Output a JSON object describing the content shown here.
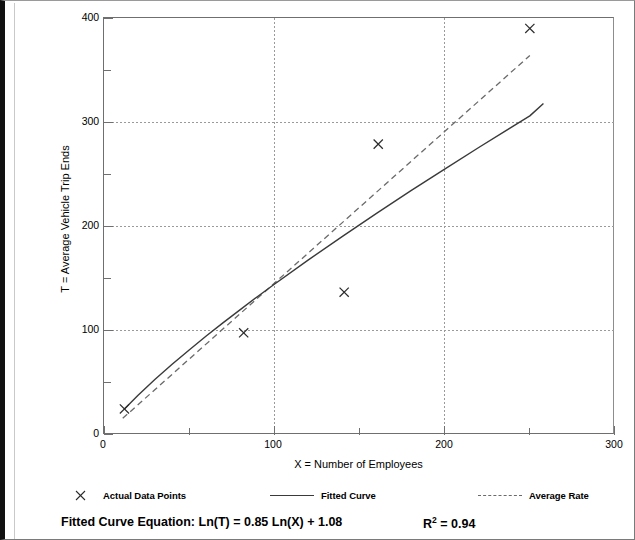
{
  "chart_data": {
    "type": "scatter",
    "title": "",
    "xlabel": "X = Number of Employees",
    "ylabel": "T = Average Vehicle Trip Ends",
    "xlim": [
      0,
      300
    ],
    "ylim": [
      0,
      400
    ],
    "x_ticks_major": [
      0,
      100,
      200,
      300
    ],
    "x_ticks_minor": [
      50,
      150,
      250
    ],
    "y_ticks_major": [
      0,
      100,
      200,
      300,
      400
    ],
    "y_ticks_minor": [
      50,
      150,
      250,
      350
    ],
    "grid": "dotted gridlines at major ticks",
    "legend_position": "below-plot",
    "series": [
      {
        "name": "Actual Data Points",
        "type": "scatter",
        "marker": "x",
        "points": [
          {
            "x": 12,
            "y": 25
          },
          {
            "x": 82,
            "y": 98
          },
          {
            "x": 141,
            "y": 137
          },
          {
            "x": 161,
            "y": 279
          },
          {
            "x": 250,
            "y": 390
          }
        ]
      },
      {
        "name": "Fitted Curve",
        "type": "line",
        "style": "solid",
        "equation": "Ln(T) = 0.85 Ln(X) + 1.08",
        "points": [
          {
            "x": 12,
            "y": 24.9
          },
          {
            "x": 20,
            "y": 38.1
          },
          {
            "x": 30,
            "y": 53.4
          },
          {
            "x": 40,
            "y": 67.8
          },
          {
            "x": 50,
            "y": 81.6
          },
          {
            "x": 60,
            "y": 94.9
          },
          {
            "x": 70,
            "y": 107.8
          },
          {
            "x": 80,
            "y": 120.3
          },
          {
            "x": 90,
            "y": 132.6
          },
          {
            "x": 100,
            "y": 144.6
          },
          {
            "x": 120,
            "y": 168.0
          },
          {
            "x": 140,
            "y": 190.6
          },
          {
            "x": 160,
            "y": 212.6
          },
          {
            "x": 180,
            "y": 234.1
          },
          {
            "x": 200,
            "y": 255.1
          },
          {
            "x": 220,
            "y": 275.8
          },
          {
            "x": 240,
            "y": 296.1
          },
          {
            "x": 250,
            "y": 306.1
          },
          {
            "x": 258,
            "y": 318.0
          }
        ]
      },
      {
        "name": "Average Rate",
        "type": "line",
        "style": "dashed",
        "points": [
          {
            "x": 11,
            "y": 16
          },
          {
            "x": 250,
            "y": 364
          }
        ]
      }
    ]
  },
  "axes": {
    "y_labels": [
      "400",
      "300",
      "200",
      "100",
      "0"
    ],
    "x_labels": [
      "0",
      "100",
      "200",
      "300"
    ],
    "y_title": "T = Average Vehicle Trip Ends",
    "x_title": "X = Number of Employees"
  },
  "legend": {
    "items": [
      {
        "marker": "x-marker",
        "label": "Actual Data Points"
      },
      {
        "marker": "solid-line",
        "label": "Fitted Curve"
      },
      {
        "marker": "dashed-line",
        "label": "Average Rate"
      }
    ]
  },
  "footer": {
    "equation_label": "Fitted Curve Equation:",
    "equation_value": "Ln(T) = 0.85 Ln(X) + 1.08",
    "equation_full": "Fitted Curve Equation:  Ln(T) = 0.85 Ln(X) + 1.08",
    "r_symbol": "R",
    "r_exponent": "2",
    "r_value": "= 0.94"
  },
  "colors": {
    "axis": "#6f6f6f",
    "grid": "#9a9a9a",
    "fitted_curve": "#3a3a3a",
    "average_rate": "#6a6a6a",
    "marker": "#2b2b2b",
    "text": "#000000",
    "frame": "#111111",
    "background": "#ffffff"
  }
}
